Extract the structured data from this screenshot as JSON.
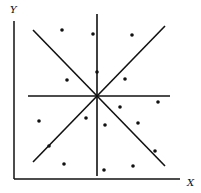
{
  "diagram": {
    "axes": {
      "y_label": "Y",
      "x_label": "X",
      "origin": [
        14,
        179
      ],
      "y_top": 21,
      "x_right": 180
    },
    "center": [
      97,
      96
    ],
    "lines": [
      {
        "name": "diagonal-nw-se",
        "x1": 33,
        "y1": 30,
        "x2": 165,
        "y2": 166
      },
      {
        "name": "diagonal-sw-ne",
        "x1": 33,
        "y1": 162,
        "x2": 165,
        "y2": 26
      },
      {
        "name": "horizontal",
        "x1": 28,
        "y1": 96,
        "x2": 170,
        "y2": 96
      },
      {
        "name": "vertical",
        "x1": 97,
        "y1": 14,
        "x2": 97,
        "y2": 176
      }
    ],
    "points": [
      [
        62,
        30
      ],
      [
        93,
        34
      ],
      [
        132,
        35
      ],
      [
        67,
        80
      ],
      [
        97,
        72
      ],
      [
        125,
        79
      ],
      [
        158,
        102
      ],
      [
        39,
        121
      ],
      [
        86,
        118
      ],
      [
        105,
        125
      ],
      [
        120,
        107
      ],
      [
        138,
        123
      ],
      [
        49,
        146
      ],
      [
        155,
        151
      ],
      [
        64,
        164
      ],
      [
        104,
        170
      ],
      [
        133,
        166
      ]
    ],
    "color": "#111111"
  }
}
